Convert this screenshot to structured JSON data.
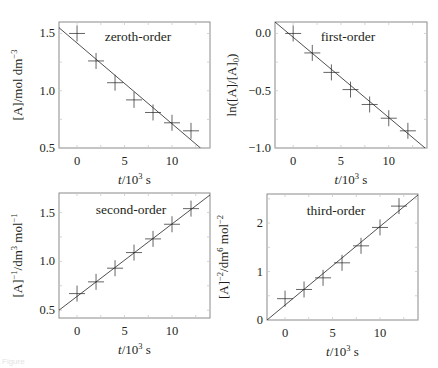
{
  "figure": {
    "caption_fragment": "Figure"
  },
  "chart_data": [
    {
      "type": "scatter",
      "id": "zeroth",
      "title": "zeroth-order",
      "xlabel": "t/10^3 s",
      "ylabel": "[A]/mol dm^-3",
      "xlim": [
        -1.9,
        14
      ],
      "ylim": [
        0.5,
        1.6
      ],
      "xticks": [
        0,
        5,
        10
      ],
      "yticks": [
        0.5,
        1.0,
        1.5
      ],
      "ytick_labels": [
        "0.5",
        "1.0",
        "1.5"
      ],
      "grid": false,
      "x": [
        0,
        2,
        4,
        6,
        8,
        10,
        12
      ],
      "y": [
        1.5,
        1.26,
        1.07,
        0.92,
        0.81,
        0.72,
        0.65
      ],
      "fit": {
        "x": [
          -1.9,
          13.0
        ],
        "y": [
          1.55,
          0.5
        ]
      }
    },
    {
      "type": "scatter",
      "id": "first",
      "title": "first-order",
      "xlabel": "t/10^3 s",
      "ylabel": "ln([A]/[A]0)",
      "xlim": [
        -1.9,
        14
      ],
      "ylim": [
        -1.0,
        0.1
      ],
      "xticks": [
        0,
        5,
        10
      ],
      "yticks": [
        -1.0,
        -0.5,
        0.0
      ],
      "ytick_labels": [
        "−1.0",
        "−0.5",
        "0.0"
      ],
      "grid": false,
      "x": [
        0,
        2,
        4,
        6,
        8,
        10,
        12
      ],
      "y": [
        0.0,
        -0.17,
        -0.34,
        -0.49,
        -0.62,
        -0.74,
        -0.85
      ],
      "fit": {
        "x": [
          -1.9,
          13.8
        ],
        "y": [
          0.1,
          -1.0
        ]
      }
    },
    {
      "type": "scatter",
      "id": "second",
      "title": "second-order",
      "xlabel": "t/10^3 s",
      "ylabel": "[A]^-1/dm^3 mol^-1",
      "xlim": [
        -1.9,
        14
      ],
      "ylim": [
        0.42,
        1.7
      ],
      "xticks": [
        0,
        5,
        10
      ],
      "yticks": [
        0.5,
        1.0,
        1.5
      ],
      "ytick_labels": [
        "0.5",
        "1.0",
        "1.5"
      ],
      "grid": false,
      "x": [
        0,
        2,
        4,
        6,
        8,
        10,
        12
      ],
      "y": [
        0.67,
        0.79,
        0.93,
        1.09,
        1.23,
        1.38,
        1.54
      ],
      "fit": {
        "x": [
          -1.9,
          14
        ],
        "y": [
          0.5,
          1.68
        ]
      }
    },
    {
      "type": "scatter",
      "id": "third",
      "title": "third-order",
      "xlabel": "t/10^3 s",
      "ylabel": "[A]^-2/dm^6 mol^-2",
      "xlim": [
        -1.9,
        14
      ],
      "ylim": [
        0,
        2.6
      ],
      "xticks": [
        0,
        5,
        10
      ],
      "yticks": [
        0,
        1,
        2
      ],
      "ytick_labels": [
        "0",
        "1",
        "2"
      ],
      "grid": false,
      "x": [
        0,
        2,
        4,
        6,
        8,
        10,
        12
      ],
      "y": [
        0.44,
        0.63,
        0.87,
        1.18,
        1.53,
        1.91,
        2.35
      ],
      "fit": {
        "x": [
          -1.9,
          14
        ],
        "y": [
          0.0,
          2.58
        ]
      }
    }
  ],
  "labels": {
    "zeroth": {
      "title": "zeroth-order",
      "ylabel_main": "[A]/mol dm",
      "ylabel_sup": "−3"
    },
    "first": {
      "title": "first-order",
      "ylabel_main": "ln([A]/[A]",
      "ylabel_sub": "0",
      "ylabel_end": ")"
    },
    "second": {
      "title": "second-order",
      "ylabel_a": "[A]",
      "ylabel_a_sup": "−1",
      "ylabel_b": "/dm",
      "ylabel_b_sup": "3",
      "ylabel_c": " mol",
      "ylabel_c_sup": "−1"
    },
    "third": {
      "title": "third-order",
      "ylabel_a": "[A]",
      "ylabel_a_sup": "−2",
      "ylabel_b": "/dm",
      "ylabel_b_sup": "6",
      "ylabel_c": " mol",
      "ylabel_c_sup": "−2"
    },
    "x_axis": {
      "var": "t",
      "unit_a": "/10",
      "unit_sup": "3",
      "unit_b": " s"
    },
    "xtick_labels": [
      "0",
      "5",
      "10"
    ]
  }
}
